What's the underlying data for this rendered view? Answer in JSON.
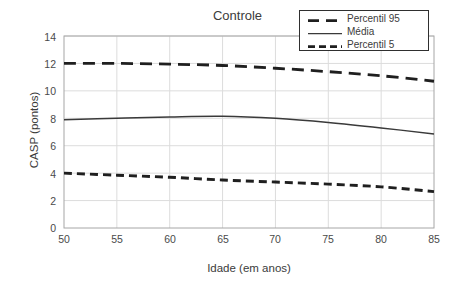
{
  "chart_data": {
    "type": "line",
    "title": "Controle",
    "xlabel": "Idade (em anos)",
    "ylabel": "CASP (pontos)",
    "xlim": [
      50,
      85
    ],
    "ylim": [
      0,
      14
    ],
    "grid": true,
    "legend_position": "top-right",
    "xticks": [
      50,
      55,
      60,
      65,
      70,
      75,
      80,
      85
    ],
    "yticks": [
      0,
      2,
      4,
      6,
      8,
      10,
      12,
      14
    ],
    "x": [
      50,
      55,
      60,
      65,
      70,
      75,
      80,
      85
    ],
    "series": [
      {
        "name": "Percentil 95",
        "style": "dashed-long",
        "color": "#1f1f1f",
        "values": [
          12.0,
          12.0,
          11.95,
          11.85,
          11.65,
          11.4,
          11.1,
          10.7
        ]
      },
      {
        "name": "Média",
        "style": "solid",
        "color": "#3a3a3a",
        "values": [
          7.9,
          8.0,
          8.1,
          8.15,
          8.0,
          7.7,
          7.3,
          6.85
        ]
      },
      {
        "name": "Percentil 5",
        "style": "dashed-short",
        "color": "#1f1f1f",
        "values": [
          4.0,
          3.85,
          3.7,
          3.5,
          3.35,
          3.2,
          3.0,
          2.65
        ]
      }
    ]
  },
  "legend": {
    "items": [
      {
        "label": "Percentil 95"
      },
      {
        "label": "Média"
      },
      {
        "label": "Percentil 5"
      }
    ]
  },
  "axes": {
    "x_tick_labels": [
      "50",
      "55",
      "60",
      "65",
      "70",
      "75",
      "80",
      "85"
    ],
    "y_tick_labels": [
      "0",
      "2",
      "4",
      "6",
      "8",
      "10",
      "12",
      "14"
    ]
  },
  "colors": {
    "background": "#ffffff",
    "grid": "#dcdcdc",
    "axis_border": "#a6a6a6",
    "line_dark": "#1f1f1f",
    "line_mean": "#3a3a3a",
    "text": "#3b3b3b"
  }
}
